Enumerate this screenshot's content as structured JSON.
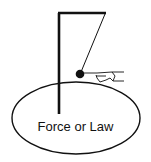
{
  "diagram": {
    "label": "Force or Law",
    "colors": {
      "stroke": "#111111",
      "background": "#ffffff"
    },
    "elements": [
      "gallows-stand",
      "pendulum-string",
      "pendulum-bob",
      "pushing-hand",
      "ellipse"
    ]
  }
}
